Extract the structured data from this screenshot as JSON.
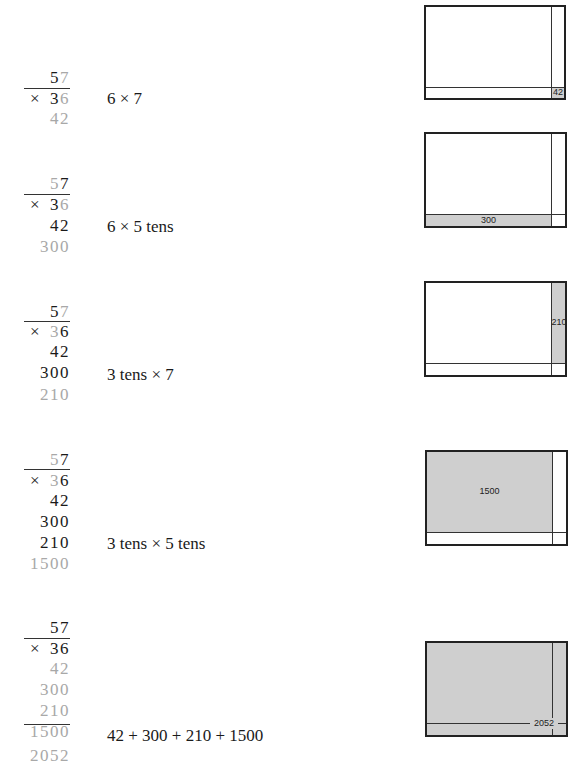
{
  "steps": [
    {
      "rows": [
        {
          "cells": [
            {
              "t": "5",
              "c": "k"
            },
            {
              "t": "7",
              "c": "g"
            }
          ]
        },
        {
          "cells": [
            {
              "t": "×",
              "c": "k",
              "op": true
            },
            {
              "t": "3",
              "c": "k"
            },
            {
              "t": "6",
              "c": "g"
            }
          ]
        },
        {
          "cells": [
            {
              "t": "4",
              "c": "g"
            },
            {
              "t": "2",
              "c": "g"
            }
          ]
        }
      ],
      "description": "6 × 7",
      "box_label": "42"
    },
    {
      "rows": [
        {
          "cells": [
            {
              "t": "5",
              "c": "g"
            },
            {
              "t": "7",
              "c": "k"
            }
          ]
        },
        {
          "cells": [
            {
              "t": "×",
              "c": "k",
              "op": true
            },
            {
              "t": "3",
              "c": "k"
            },
            {
              "t": "6",
              "c": "g"
            }
          ]
        },
        {
          "cells": [
            {
              "t": "4",
              "c": "k"
            },
            {
              "t": "2",
              "c": "k"
            }
          ]
        },
        {
          "cells": [
            {
              "t": "3",
              "c": "g"
            },
            {
              "t": "0",
              "c": "g"
            },
            {
              "t": "0",
              "c": "g"
            }
          ]
        }
      ],
      "description": "6 × 5 tens",
      "box_label": "300"
    },
    {
      "rows": [
        {
          "cells": [
            {
              "t": "5",
              "c": "k"
            },
            {
              "t": "7",
              "c": "g"
            }
          ]
        },
        {
          "cells": [
            {
              "t": "×",
              "c": "k",
              "op": true
            },
            {
              "t": "3",
              "c": "g"
            },
            {
              "t": "6",
              "c": "k"
            }
          ]
        },
        {
          "cells": [
            {
              "t": "4",
              "c": "k"
            },
            {
              "t": "2",
              "c": "k"
            }
          ]
        },
        {
          "cells": [
            {
              "t": "3",
              "c": "k"
            },
            {
              "t": "0",
              "c": "k"
            },
            {
              "t": "0",
              "c": "k"
            }
          ]
        },
        {
          "cells": [
            {
              "t": "2",
              "c": "g"
            },
            {
              "t": "1",
              "c": "g"
            },
            {
              "t": "0",
              "c": "g"
            }
          ]
        }
      ],
      "description": "3 tens × 7",
      "box_label": "210"
    },
    {
      "rows": [
        {
          "cells": [
            {
              "t": "5",
              "c": "g"
            },
            {
              "t": "7",
              "c": "k"
            }
          ]
        },
        {
          "cells": [
            {
              "t": "×",
              "c": "k",
              "op": true
            },
            {
              "t": "3",
              "c": "g"
            },
            {
              "t": "6",
              "c": "k"
            }
          ]
        },
        {
          "cells": [
            {
              "t": "4",
              "c": "k"
            },
            {
              "t": "2",
              "c": "k"
            }
          ]
        },
        {
          "cells": [
            {
              "t": "3",
              "c": "k"
            },
            {
              "t": "0",
              "c": "k"
            },
            {
              "t": "0",
              "c": "k"
            }
          ]
        },
        {
          "cells": [
            {
              "t": "2",
              "c": "k"
            },
            {
              "t": "1",
              "c": "k"
            },
            {
              "t": "0",
              "c": "k"
            }
          ]
        },
        {
          "cells": [
            {
              "t": "1",
              "c": "g"
            },
            {
              "t": "5",
              "c": "g"
            },
            {
              "t": "0",
              "c": "g"
            },
            {
              "t": "0",
              "c": "g"
            }
          ]
        }
      ],
      "description": "3 tens × 5 tens",
      "box_label": "1500"
    },
    {
      "rows": [
        {
          "cells": [
            {
              "t": "5",
              "c": "k"
            },
            {
              "t": "7",
              "c": "k"
            }
          ]
        },
        {
          "cells": [
            {
              "t": "×",
              "c": "k",
              "op": true
            },
            {
              "t": "3",
              "c": "k"
            },
            {
              "t": "6",
              "c": "k"
            }
          ]
        },
        {
          "cells": [
            {
              "t": "4",
              "c": "g"
            },
            {
              "t": "2",
              "c": "g"
            }
          ]
        },
        {
          "cells": [
            {
              "t": "3",
              "c": "g"
            },
            {
              "t": "0",
              "c": "g"
            },
            {
              "t": "0",
              "c": "g"
            }
          ]
        },
        {
          "cells": [
            {
              "t": "2",
              "c": "g"
            },
            {
              "t": "1",
              "c": "g"
            },
            {
              "t": "0",
              "c": "g"
            }
          ]
        },
        {
          "cells": [
            {
              "t": "1",
              "c": "g"
            },
            {
              "t": "5",
              "c": "g"
            },
            {
              "t": "0",
              "c": "g"
            },
            {
              "t": "0",
              "c": "g"
            }
          ]
        },
        {
          "cells": [
            {
              "t": "2",
              "c": "g"
            },
            {
              "t": "0",
              "c": "g"
            },
            {
              "t": "5",
              "c": "g"
            },
            {
              "t": "2",
              "c": "g"
            }
          ]
        }
      ],
      "description": "42 + 300 + 210 + 1500",
      "box_label": "2052"
    }
  ],
  "colors": {
    "highlight_digit": "#a8a8a8",
    "normal_digit": "#1a1a1a",
    "shade": "#cfcfcf",
    "border": "#222222"
  }
}
